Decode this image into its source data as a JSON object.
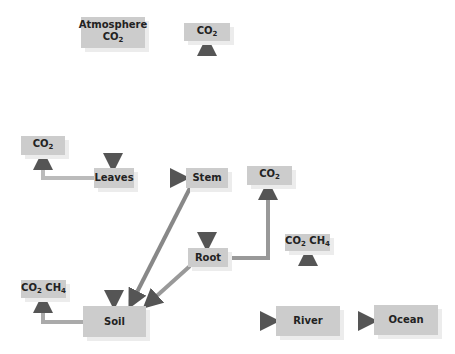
{
  "diagram": {
    "title": "",
    "nodes": {
      "atmosphere": {
        "line1": "Atmosphere",
        "line2": "CO",
        "sub": "2"
      },
      "stem_co2": {
        "text": "CO",
        "sub": "2"
      },
      "leaves_co2": {
        "text": "CO",
        "sub": "2"
      },
      "leaves": {
        "text": "Leaves"
      },
      "stem": {
        "text": "Stem"
      },
      "root_co2": {
        "text": "CO",
        "sub": "2"
      },
      "root": {
        "text": "Root"
      },
      "river_gas": {
        "a": "CO",
        "asub": "2",
        "b": " CH",
        "bsub": "4"
      },
      "soil_gas": {
        "a": "CO",
        "asub": "2",
        "b": " CH",
        "bsub": "4"
      },
      "soil": {
        "text": "Soil"
      },
      "river": {
        "text": "River"
      },
      "ocean": {
        "text": "Ocean"
      }
    },
    "edges": [
      {
        "from": "Atmosphere CO2",
        "to": "Leaves"
      },
      {
        "from": "Leaves",
        "to": "CO2 (left)"
      },
      {
        "from": "Leaves",
        "to": "Stem"
      },
      {
        "from": "Leaves",
        "to": "Soil"
      },
      {
        "from": "Stem",
        "to": "CO2 (top)"
      },
      {
        "from": "Stem",
        "to": "Root"
      },
      {
        "from": "Stem",
        "to": "Soil"
      },
      {
        "from": "Root",
        "to": "CO2 (right)"
      },
      {
        "from": "Root",
        "to": "Soil"
      },
      {
        "from": "Soil",
        "to": "CO2 CH4 (left)"
      },
      {
        "from": "Soil",
        "to": "River"
      },
      {
        "from": "River",
        "to": "CO2 CH4 (river)"
      },
      {
        "from": "River",
        "to": "Ocean"
      }
    ],
    "colors": {
      "box": "#cccccc",
      "shadow": "#ececec",
      "arrow_dark": "#555555",
      "arrow_light": "#dddddd"
    }
  }
}
